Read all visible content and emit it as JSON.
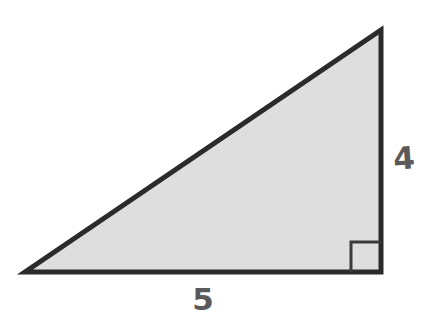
{
  "figure": {
    "kind": "right-triangle-diagram",
    "background_color": "#ffffff",
    "fill_color": "#dedede",
    "stroke_color": "#2b2b2b",
    "stroke_width": 5,
    "label_color": "#5a5a5a",
    "right_angle_marker": {
      "name": "right-angle-marker",
      "size": 30,
      "stroke_color": "#3a3a3a",
      "stroke_width": 3
    },
    "vertices": {
      "bottom_left": [
        25,
        272
      ],
      "bottom_right": [
        381,
        272
      ],
      "top_right": [
        381,
        30
      ]
    },
    "labels": {
      "base": "5",
      "height": "4"
    }
  },
  "chart_data": {
    "type": "diagram",
    "title": "",
    "shape": "right triangle",
    "sides": [
      {
        "name": "base",
        "label": "5",
        "value": 5,
        "position": "bottom",
        "pixel_length": 356
      },
      {
        "name": "height",
        "label": "4",
        "value": 4,
        "position": "right",
        "pixel_length": 242
      },
      {
        "name": "hypotenuse",
        "label": "",
        "value": null,
        "position": "upper-left"
      }
    ],
    "angles": [
      {
        "vertex": "bottom-right",
        "measure": 90,
        "marked": true
      }
    ],
    "annotations": [
      "5",
      "4"
    ],
    "legend": null,
    "grid": false
  }
}
